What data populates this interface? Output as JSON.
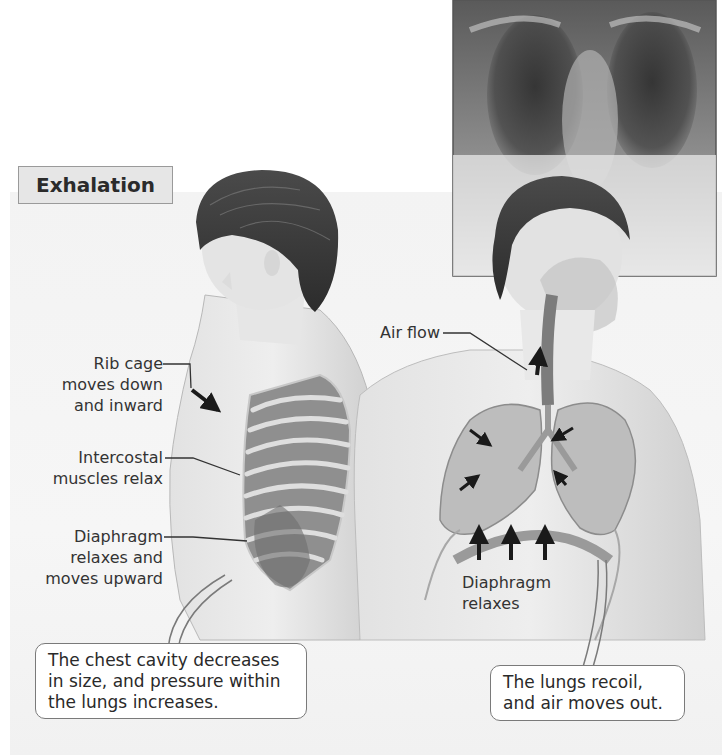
{
  "figure": {
    "title": "Exhalation",
    "colors": {
      "background": "#ffffff",
      "panel": "#f3f3f3",
      "title_tab_fill": "#e6e6e6",
      "title_tab_border": "#9a9a9a",
      "text": "#2a2a2a",
      "callout_border": "#7a7a7a",
      "leader_line": "#333333"
    },
    "side_figure": {
      "labels": [
        {
          "id": "rib-cage",
          "lines": [
            "Rib cage",
            "moves down",
            "and inward"
          ]
        },
        {
          "id": "intercostal",
          "lines": [
            "Intercostal",
            "muscles relax"
          ]
        },
        {
          "id": "diaphragm",
          "lines": [
            "Diaphragm",
            "relaxes and",
            "moves upward"
          ]
        }
      ]
    },
    "front_figure": {
      "labels": [
        {
          "id": "air-flow",
          "lines": [
            "Air flow"
          ]
        },
        {
          "id": "diaphragm-relaxes",
          "lines": [
            "Diaphragm",
            "relaxes"
          ]
        }
      ]
    },
    "callouts": [
      {
        "id": "chest-cavity",
        "lines": [
          "The chest cavity decreases",
          "in size, and pressure within",
          "the lungs increases."
        ]
      },
      {
        "id": "lungs-recoil",
        "lines": [
          "The lungs recoil,",
          "and air moves out."
        ]
      }
    ],
    "inset_image": {
      "subject": "chest x-ray"
    }
  }
}
